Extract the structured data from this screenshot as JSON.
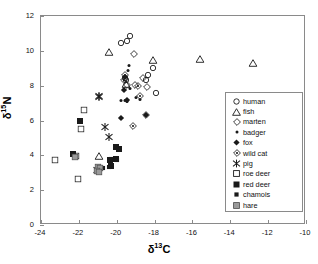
{
  "chart_data": {
    "type": "scatter",
    "title": "",
    "xlabel": "δ13C",
    "ylabel": "δ15N",
    "xlabel_parts": {
      "prefix": "δ",
      "sup": "13",
      "suffix": "C"
    },
    "ylabel_parts": {
      "prefix": "δ",
      "sup": "15",
      "suffix": "N"
    },
    "xlim": [
      -24,
      -10
    ],
    "ylim": [
      0,
      12
    ],
    "xticks": [
      -24,
      -22,
      -20,
      -18,
      -16,
      -14,
      -12,
      -10
    ],
    "yticks": [
      0,
      2,
      4,
      6,
      8,
      10,
      12
    ],
    "xtick_labels": [
      "-24",
      "-22",
      "-20",
      "-18",
      "-16",
      "-14",
      "-12",
      "-10"
    ],
    "ytick_labels": [
      "0",
      "2",
      "4",
      "6",
      "8",
      "10",
      "12"
    ],
    "grid": false,
    "legend_position": "center-right",
    "series": [
      {
        "name": "human",
        "marker": "open-circle",
        "points": [
          [
            -19.75,
            10.45
          ],
          [
            -19.45,
            10.55
          ],
          [
            -19.3,
            10.85
          ],
          [
            -19.55,
            8.45
          ],
          [
            -19.5,
            8.3
          ],
          [
            -18.35,
            8.6
          ],
          [
            -18.1,
            9.0
          ],
          [
            -18.45,
            8.35
          ],
          [
            -17.95,
            7.6
          ]
        ]
      },
      {
        "name": "fish",
        "marker": "open-triangle",
        "points": [
          [
            -20.4,
            9.95
          ],
          [
            -19.5,
            8.1
          ],
          [
            -18.1,
            9.45
          ],
          [
            -15.6,
            9.55
          ],
          [
            -12.8,
            9.3
          ],
          [
            -20.95,
            3.95
          ]
        ]
      },
      {
        "name": "marten",
        "marker": "open-diamond-thin",
        "points": [
          [
            -19.1,
            9.8
          ],
          [
            -19.45,
            8.05
          ],
          [
            -19.05,
            8.05
          ],
          [
            -18.6,
            8.45
          ],
          [
            -18.4,
            7.95
          ],
          [
            -18.45,
            6.3
          ]
        ]
      },
      {
        "name": "badger",
        "marker": "small-dot",
        "points": [
          [
            -19.35,
            9.2
          ],
          [
            -19.4,
            8.9
          ],
          [
            -19.3,
            7.85
          ],
          [
            -19.55,
            7.2
          ],
          [
            -19.0,
            7.35
          ],
          [
            -18.75,
            7.25
          ],
          [
            -19.75,
            7.15
          ],
          [
            -19.45,
            7.1
          ]
        ]
      },
      {
        "name": "fox",
        "marker": "filled-diamond",
        "points": [
          [
            -19.55,
            8.5
          ],
          [
            -19.6,
            7.75
          ],
          [
            -19.45,
            7.15
          ],
          [
            -19.8,
            6.15
          ],
          [
            -18.45,
            6.3
          ]
        ]
      },
      {
        "name": "wild cat",
        "marker": "open-diamond-dot",
        "points": [
          [
            -19.55,
            8.6
          ],
          [
            -19.6,
            8.35
          ],
          [
            -18.9,
            8.0
          ],
          [
            -18.75,
            7.4
          ],
          [
            -19.15,
            5.7
          ]
        ]
      },
      {
        "name": "pig",
        "marker": "asterisk",
        "points": [
          [
            -20.95,
            7.4
          ],
          [
            -20.95,
            7.35
          ],
          [
            -20.6,
            5.65
          ],
          [
            -20.4,
            5.05
          ],
          [
            -21.05,
            3.15
          ]
        ]
      },
      {
        "name": "roe deer",
        "marker": "open-square",
        "points": [
          [
            -21.75,
            6.6
          ],
          [
            -21.9,
            5.5
          ],
          [
            -23.25,
            3.75
          ],
          [
            -22.15,
            3.95
          ],
          [
            -22.05,
            2.65
          ]
        ]
      },
      {
        "name": "red deer",
        "marker": "filled-square",
        "points": [
          [
            -21.95,
            5.95
          ],
          [
            -22.3,
            4.05
          ],
          [
            -20.35,
            3.75
          ],
          [
            -20.05,
            3.8
          ],
          [
            -19.9,
            4.35
          ],
          [
            -20.05,
            4.5
          ],
          [
            -20.3,
            3.4
          ]
        ]
      },
      {
        "name": "chamois",
        "marker": "small-filled-square",
        "points": [
          [
            -20.3,
            3.8
          ],
          [
            -20.0,
            3.75
          ],
          [
            -20.4,
            3.35
          ],
          [
            -20.85,
            3.3
          ],
          [
            -20.75,
            3.25
          ]
        ]
      },
      {
        "name": "hare",
        "marker": "gray-square",
        "points": [
          [
            -21.0,
            3.35
          ],
          [
            -20.9,
            3.3
          ],
          [
            -21.05,
            3.1
          ],
          [
            -20.95,
            3.05
          ],
          [
            -22.2,
            3.9
          ]
        ]
      }
    ]
  },
  "legend": {
    "items": [
      {
        "label": "human",
        "marker": "open-circle"
      },
      {
        "label": "fish",
        "marker": "open-triangle"
      },
      {
        "label": "marten",
        "marker": "open-diamond-thin"
      },
      {
        "label": "badger",
        "marker": "small-dot"
      },
      {
        "label": "fox",
        "marker": "filled-diamond"
      },
      {
        "label": "wild cat",
        "marker": "open-diamond-dot"
      },
      {
        "label": "pig",
        "marker": "asterisk"
      },
      {
        "label": "roe deer",
        "marker": "open-square"
      },
      {
        "label": "red deer",
        "marker": "filled-square"
      },
      {
        "label": "chamois",
        "marker": "small-filled-square"
      },
      {
        "label": "hare",
        "marker": "gray-square"
      }
    ]
  },
  "colors": {
    "axis": "#8a8a8a",
    "marker": "#1a1a1a",
    "hare_fill": "#9a9a9a",
    "background": "#ffffff"
  }
}
